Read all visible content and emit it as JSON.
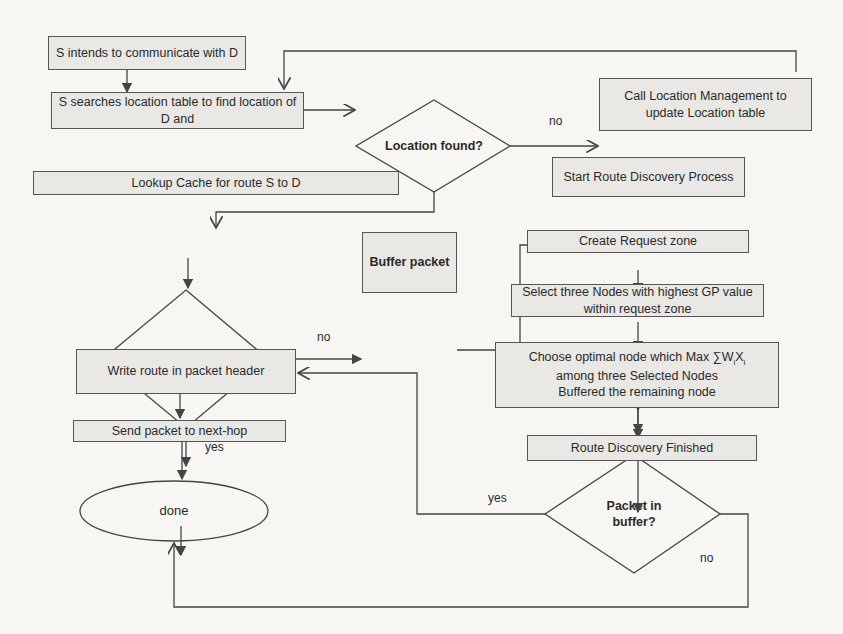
{
  "flowchart": {
    "nodes": {
      "start": {
        "text": "S  intends to communicate with  D"
      },
      "search": {
        "text": "S searches location table to find location of  D  and"
      },
      "location_found": {
        "text": "Location found?"
      },
      "call_location_mgmt": {
        "text": "Call Location Management to update Location table"
      },
      "lookup_cache": {
        "text": "Lookup Cache for route  S to D"
      },
      "route_found": {
        "text": "Route found?"
      },
      "buffer_packet": {
        "text": "Buffer packet"
      },
      "start_route_discovery": {
        "text": "Start Route Discovery Process"
      },
      "create_request_zone": {
        "text": "Create Request zone"
      },
      "select_three_nodes": {
        "text": "Select  three Nodes with highest GP value within request zone"
      },
      "choose_optimal": {
        "line1_prefix": "Choose optimal node  which Max ∑W",
        "sub_i": "i",
        "x": "X",
        "line2": "among three Selected Nodes",
        "line3": "Buffered the remaining node"
      },
      "write_route": {
        "text": "Write route in packet header"
      },
      "send_packet": {
        "text": "Send packet to next-hop"
      },
      "route_discovery_finished": {
        "text": "Route Discovery Finished"
      },
      "packet_in_buffer": {
        "text": "Packet in buffer?"
      },
      "done": {
        "text": "done"
      }
    },
    "edge_labels": {
      "location_no": "no",
      "route_no": "no",
      "route_yes": "yes",
      "buffer_yes": "yes",
      "buffer_no": "no"
    },
    "colors": {
      "box_fill": "#e9e8e4",
      "stroke": "#555555",
      "background": "#f7f6f2"
    }
  }
}
